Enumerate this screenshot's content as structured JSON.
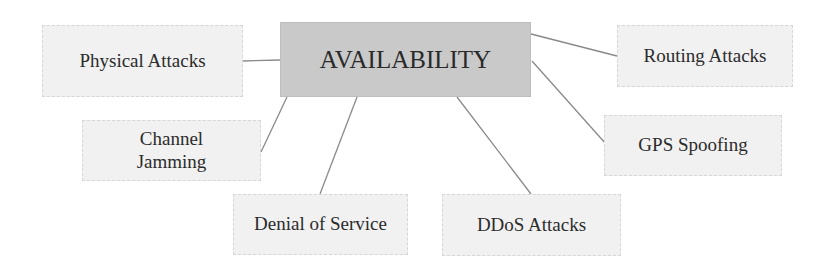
{
  "diagram": {
    "center": {
      "id": "availability",
      "label": "AVAILABILITY",
      "fill": "#c9c9c9",
      "box": [
        280,
        22,
        251,
        75
      ]
    },
    "nodes": [
      {
        "id": "physical-attacks",
        "label": "Physical Attacks",
        "box": [
          42,
          25,
          201,
          72
        ]
      },
      {
        "id": "routing-attacks",
        "label": "Routing Attacks",
        "box": [
          617,
          25,
          176,
          62
        ]
      },
      {
        "id": "channel-jamming",
        "label": "Channel Jamming",
        "lines": [
          "Channel",
          "Jamming"
        ],
        "box": [
          82,
          120,
          179,
          61
        ]
      },
      {
        "id": "gps-spoofing",
        "label": "GPS Spoofing",
        "box": [
          604,
          115,
          178,
          61
        ]
      },
      {
        "id": "denial-of-service",
        "label": "Denial of Service",
        "box": [
          233,
          194,
          175,
          61
        ]
      },
      {
        "id": "ddos-attacks",
        "label": "DDoS Attacks",
        "box": [
          442,
          194,
          179,
          62
        ]
      }
    ],
    "edges": [
      {
        "from": "physical-attacks",
        "to": "availability",
        "x1": 243,
        "y1": 61,
        "x2": 280,
        "y2": 60
      },
      {
        "from": "availability",
        "to": "routing-attacks",
        "x1": 531,
        "y1": 34,
        "x2": 617,
        "y2": 56
      },
      {
        "from": "channel-jamming",
        "to": "availability",
        "x1": 261,
        "y1": 152,
        "x2": 287,
        "y2": 97
      },
      {
        "from": "denial-of-service",
        "to": "availability",
        "x1": 320,
        "y1": 194,
        "x2": 357,
        "y2": 97
      },
      {
        "from": "ddos-attacks",
        "to": "availability",
        "x1": 531,
        "y1": 194,
        "x2": 457,
        "y2": 97
      },
      {
        "from": "gps-spoofing",
        "to": "availability",
        "x1": 606,
        "y1": 144,
        "x2": 532,
        "y2": 61
      }
    ],
    "colors": {
      "leaf_fill": "#f1f1f1",
      "edge": "#8a8a8a",
      "text": "#2b2b2b"
    }
  }
}
